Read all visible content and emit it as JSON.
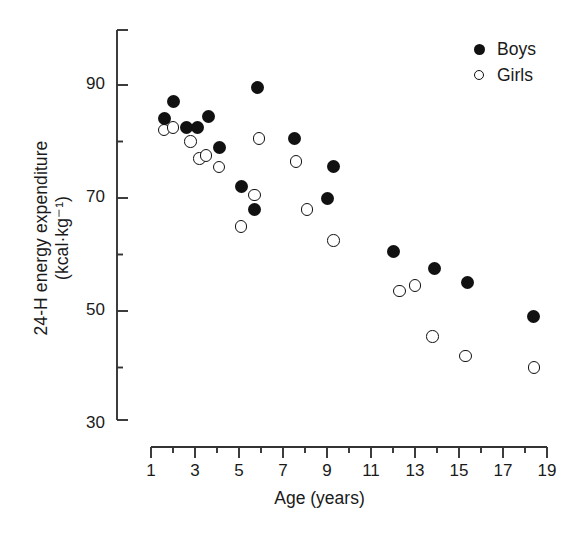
{
  "chart_data": {
    "type": "scatter",
    "title": "",
    "xlabel": "Age (years)",
    "ylabel_line1": "24-H energy expenditure",
    "ylabel_line2": "(kcal·kg⁻¹)",
    "xlim": [
      1,
      19
    ],
    "ylim": [
      30,
      100
    ],
    "xticks": [
      "1",
      "3",
      "5",
      "7",
      "9",
      "11",
      "13",
      "15",
      "17",
      "19"
    ],
    "xtick_values": [
      1,
      3,
      5,
      7,
      9,
      11,
      13,
      15,
      17,
      19
    ],
    "xminor_values": [
      2,
      4,
      6,
      8,
      10,
      12,
      14,
      16,
      18
    ],
    "yticks": [
      "90",
      "70",
      "50",
      "30"
    ],
    "ytick_values": [
      90,
      70,
      50,
      30
    ],
    "yminor_values": [
      80,
      60,
      40
    ],
    "grid": false,
    "legend_position": "top-right",
    "series": [
      {
        "name": "Boys",
        "marker": "filled-circle",
        "color": "#111111",
        "points": [
          [
            1.6,
            84.0
          ],
          [
            2.0,
            87.0
          ],
          [
            2.6,
            82.5
          ],
          [
            3.1,
            82.5
          ],
          [
            3.6,
            84.5
          ],
          [
            4.1,
            79.0
          ],
          [
            5.1,
            72.0
          ],
          [
            5.7,
            68.0
          ],
          [
            5.85,
            89.5
          ],
          [
            7.5,
            80.5
          ],
          [
            9.0,
            70.0
          ],
          [
            9.3,
            75.5
          ],
          [
            12.0,
            60.5
          ],
          [
            13.9,
            57.5
          ],
          [
            15.4,
            55.0
          ],
          [
            18.4,
            49.0
          ]
        ]
      },
      {
        "name": "Girls",
        "marker": "open-circle",
        "color": "#111111",
        "points": [
          [
            1.6,
            82.0
          ],
          [
            2.0,
            82.5
          ],
          [
            2.8,
            80.0
          ],
          [
            3.2,
            77.0
          ],
          [
            3.5,
            77.5
          ],
          [
            4.1,
            75.5
          ],
          [
            5.1,
            65.0
          ],
          [
            5.7,
            70.5
          ],
          [
            5.9,
            80.5
          ],
          [
            7.6,
            76.5
          ],
          [
            8.1,
            68.0
          ],
          [
            9.3,
            62.5
          ],
          [
            12.3,
            53.5
          ],
          [
            13.0,
            54.5
          ],
          [
            13.8,
            45.5
          ],
          [
            15.3,
            42.0
          ],
          [
            18.4,
            40.0
          ]
        ]
      }
    ]
  },
  "legend": {
    "items": [
      {
        "label": "Boys",
        "marker": "filled-circle"
      },
      {
        "label": "Girls",
        "marker": "open-circle"
      }
    ]
  },
  "axes": {
    "x_label": "Age (years)",
    "y_label_line1": "24-H energy expenditure",
    "y_label_line2": "(kcal·kg⁻¹)"
  }
}
